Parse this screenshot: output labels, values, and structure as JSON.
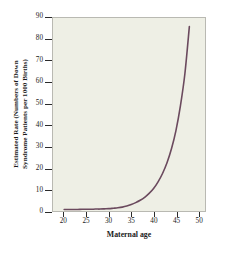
{
  "chart_data": {
    "type": "line",
    "title": "",
    "xlabel": "Maternal age",
    "ylabel": "Estimated Rate (Numbers of Down Syndrome Patients per 1000 Births)",
    "ylabel_lines": [
      "Estimated Rate (Numbers of Down",
      "Syndrome Patients per 1000 Births)"
    ],
    "xlim": [
      17.5,
      51.5
    ],
    "ylim": [
      0,
      90
    ],
    "xticks": [
      20,
      25,
      30,
      35,
      40,
      45,
      50
    ],
    "yticks": [
      0,
      10,
      20,
      30,
      40,
      50,
      60,
      70,
      80,
      90
    ],
    "xtick_labels": [
      "20",
      "25",
      "30",
      "35",
      "40",
      "45",
      "50"
    ],
    "ytick_labels": [
      "0",
      "10",
      "20",
      "30",
      "40",
      "50",
      "60",
      "70",
      "80",
      "90"
    ],
    "grid": false,
    "legend": false,
    "series": [
      {
        "name": "Estimated rate of Down syndrome",
        "color": "#6b4a5e",
        "linewidth": 1.6,
        "x": [
          20,
          21,
          22,
          23,
          24,
          25,
          26,
          27,
          28,
          29,
          30,
          31,
          32,
          33,
          34,
          35,
          36,
          37,
          38,
          39,
          40,
          41,
          42,
          43,
          44,
          45,
          46,
          47,
          48
        ],
        "y": [
          0.7,
          0.7,
          0.7,
          0.7,
          0.8,
          0.8,
          0.8,
          0.9,
          0.9,
          1.0,
          1.1,
          1.3,
          1.5,
          1.8,
          2.3,
          3.0,
          3.9,
          5.0,
          6.4,
          8.2,
          10.5,
          13.6,
          17.5,
          22.5,
          29.0,
          37.5,
          49.0,
          64.0,
          86.0
        ]
      }
    ]
  },
  "figure": {
    "panel_color": "#eeefe5",
    "frame_color": "#b9b9b2",
    "background": "#ffffff",
    "tick_color": "#2b2b2b",
    "text_color": "#1a1a1a"
  }
}
